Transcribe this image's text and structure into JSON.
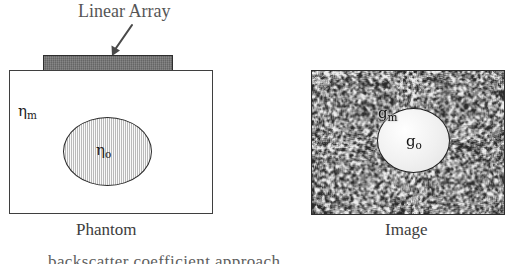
{
  "figure": {
    "type": "scientific-diagram",
    "background_color": "#ffffff"
  },
  "phantom_panel": {
    "title_label": "Linear Array",
    "caption": "Phantom",
    "background_symbol": "η",
    "background_subscript": "m",
    "inclusion_symbol": "η",
    "inclusion_subscript": "o",
    "transducer_color": "#6e6e6e",
    "box_outline_color": "#3f3f3f",
    "inclusion_fill_color": "#dedede"
  },
  "image_panel": {
    "caption": "Image",
    "background_symbol": "g",
    "background_subscript": "m",
    "inclusion_symbol": "g",
    "inclusion_subscript": "o",
    "speckle_mean_color": "#9a9a9a",
    "inclusion_fill_color": "#f2f2f2",
    "box_outline_color": "#2e2e2e"
  },
  "body_text": {
    "clipped_line": "backscatter coefficient approach",
    "note": "top of letters only, clipped by image bottom edge"
  }
}
